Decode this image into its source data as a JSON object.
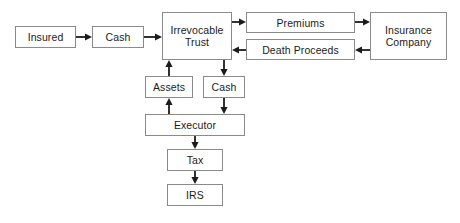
{
  "diagram": {
    "style": {
      "box_border_color": "#8a8a8a",
      "box_fill_color": "#ffffff",
      "text_color": "#1b1b1b",
      "arrow_color": "#1b1b1b",
      "canvas_background": "#ffffff"
    },
    "nodes": [
      {
        "id": "insured",
        "label": "Insured",
        "x": 15,
        "y": 26,
        "w": 61,
        "h": 22
      },
      {
        "id": "cash_top",
        "label": "Cash",
        "x": 92,
        "y": 26,
        "w": 52,
        "h": 22
      },
      {
        "id": "irrevocable_trust",
        "label": "Irrevocable\nTrust",
        "x": 162,
        "y": 12,
        "w": 70,
        "h": 48
      },
      {
        "id": "premiums",
        "label": "Premiums",
        "x": 246,
        "y": 12,
        "w": 109,
        "h": 21
      },
      {
        "id": "death_proceeds",
        "label": "Death Proceeds",
        "x": 246,
        "y": 39,
        "w": 109,
        "h": 21
      },
      {
        "id": "insurance_company",
        "label": "Insurance\nCompany",
        "x": 370,
        "y": 12,
        "w": 77,
        "h": 48
      },
      {
        "id": "assets",
        "label": "Assets",
        "x": 145,
        "y": 76,
        "w": 48,
        "h": 22
      },
      {
        "id": "cash_mid",
        "label": "Cash",
        "x": 203,
        "y": 76,
        "w": 42,
        "h": 22
      },
      {
        "id": "executor",
        "label": "Executor",
        "x": 145,
        "y": 114,
        "w": 100,
        "h": 22
      },
      {
        "id": "tax",
        "label": "Tax",
        "x": 167,
        "y": 149,
        "w": 56,
        "h": 22
      },
      {
        "id": "irs",
        "label": "IRS",
        "x": 167,
        "y": 184,
        "w": 56,
        "h": 22
      }
    ],
    "edges": [
      {
        "id": "insured-to-cash",
        "from": "insured",
        "to": "cash_top",
        "direction": "right",
        "x1": 76,
        "y1": 37,
        "x2": 92,
        "y2": 37
      },
      {
        "id": "cash-to-trust",
        "from": "cash_top",
        "to": "irrevocable_trust",
        "direction": "right",
        "x1": 144,
        "y1": 37,
        "x2": 162,
        "y2": 37
      },
      {
        "id": "trust-to-premiums",
        "from": "irrevocable_trust",
        "to": "premiums",
        "direction": "right",
        "x1": 232,
        "y1": 22,
        "x2": 246,
        "y2": 22
      },
      {
        "id": "premiums-to-insurance",
        "from": "premiums",
        "to": "insurance_company",
        "direction": "right",
        "x1": 355,
        "y1": 22,
        "x2": 370,
        "y2": 22
      },
      {
        "id": "insurance-to-death-proceeds",
        "from": "insurance_company",
        "to": "death_proceeds",
        "direction": "left",
        "x1": 370,
        "y1": 50,
        "x2": 355,
        "y2": 50
      },
      {
        "id": "death-proceeds-to-trust",
        "from": "death_proceeds",
        "to": "irrevocable_trust",
        "direction": "left",
        "x1": 246,
        "y1": 50,
        "x2": 232,
        "y2": 50
      },
      {
        "id": "assets-to-trust",
        "from": "assets",
        "to": "irrevocable_trust",
        "direction": "up",
        "x1": 169,
        "y1": 76,
        "x2": 169,
        "y2": 60
      },
      {
        "id": "trust-to-cash-mid",
        "from": "irrevocable_trust",
        "to": "cash_mid",
        "direction": "down",
        "x1": 224,
        "y1": 60,
        "x2": 224,
        "y2": 76
      },
      {
        "id": "executor-to-assets",
        "from": "executor",
        "to": "assets",
        "direction": "up",
        "x1": 169,
        "y1": 114,
        "x2": 169,
        "y2": 98
      },
      {
        "id": "cash-mid-to-executor",
        "from": "cash_mid",
        "to": "executor",
        "direction": "down",
        "x1": 224,
        "y1": 98,
        "x2": 224,
        "y2": 114
      },
      {
        "id": "executor-to-tax",
        "from": "executor",
        "to": "tax",
        "direction": "down",
        "x1": 195,
        "y1": 136,
        "x2": 195,
        "y2": 149
      },
      {
        "id": "tax-to-irs",
        "from": "tax",
        "to": "irs",
        "direction": "down",
        "x1": 195,
        "y1": 171,
        "x2": 195,
        "y2": 184
      }
    ]
  }
}
